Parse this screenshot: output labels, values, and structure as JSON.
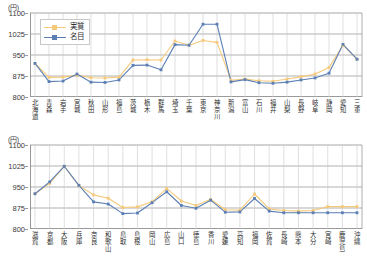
{
  "unit_label": "(円)",
  "legend": {
    "position": "top-left",
    "entries": [
      {
        "label": "実質",
        "color": "#f5c97a"
      },
      {
        "label": "名目",
        "color": "#5b7fb4"
      }
    ]
  },
  "chart_data": [
    {
      "type": "line",
      "panel": "top",
      "title": "",
      "xlabel": "",
      "ylabel": "(円)",
      "ylim": [
        800,
        1100
      ],
      "yticks": [
        800,
        875,
        950,
        1025,
        1100
      ],
      "grid": true,
      "legend_position": "top-left",
      "categories": [
        "北海道",
        "青森",
        "岩手",
        "宮城",
        "秋田",
        "山形",
        "福島",
        "茨城",
        "栃木",
        "群馬",
        "埼玉",
        "千葉",
        "東京",
        "神奈川",
        "新潟",
        "富山",
        "石川",
        "福井",
        "山梨",
        "長野",
        "岐阜",
        "静岡",
        "愛知",
        "三重"
      ],
      "series": [
        {
          "name": "実質",
          "color": "#f5c97a",
          "values": [
            920,
            870,
            871,
            878,
            869,
            868,
            871,
            932,
            933,
            932,
            1000,
            985,
            1002,
            995,
            860,
            864,
            858,
            856,
            864,
            872,
            882,
            905,
            985,
            935
          ]
        },
        {
          "name": "名目",
          "color": "#5b7fb4",
          "values": [
            920,
            855,
            857,
            882,
            853,
            852,
            861,
            913,
            914,
            897,
            987,
            985,
            1060,
            1060,
            854,
            862,
            851,
            849,
            853,
            861,
            868,
            885,
            988,
            935
          ]
        }
      ]
    },
    {
      "type": "line",
      "panel": "bottom",
      "title": "",
      "xlabel": "",
      "ylabel": "(円)",
      "ylim": [
        800,
        1100
      ],
      "yticks": [
        800,
        875,
        950,
        1025,
        1100
      ],
      "grid": true,
      "legend_position": "none",
      "categories": [
        "滋賀",
        "京都",
        "大阪",
        "兵庫",
        "奈良",
        "和歌山",
        "鳥取",
        "島根",
        "岡山",
        "広島",
        "山口",
        "徳島",
        "香川",
        "愛媛",
        "高知",
        "福岡",
        "佐賀",
        "長崎",
        "熊本",
        "大分",
        "宮崎",
        "鹿児島",
        "沖縄"
      ],
      "series": [
        {
          "name": "実質",
          "color": "#f5c97a",
          "values": [
            926,
            963,
            1024,
            955,
            922,
            910,
            877,
            879,
            897,
            945,
            900,
            884,
            906,
            869,
            867,
            925,
            872,
            866,
            864,
            866,
            880,
            880,
            880
          ]
        },
        {
          "name": "名目",
          "color": "#5b7fb4",
          "values": [
            926,
            968,
            1024,
            956,
            897,
            889,
            855,
            857,
            894,
            933,
            884,
            874,
            903,
            860,
            861,
            909,
            864,
            858,
            858,
            858,
            858,
            858,
            858
          ]
        }
      ]
    }
  ]
}
